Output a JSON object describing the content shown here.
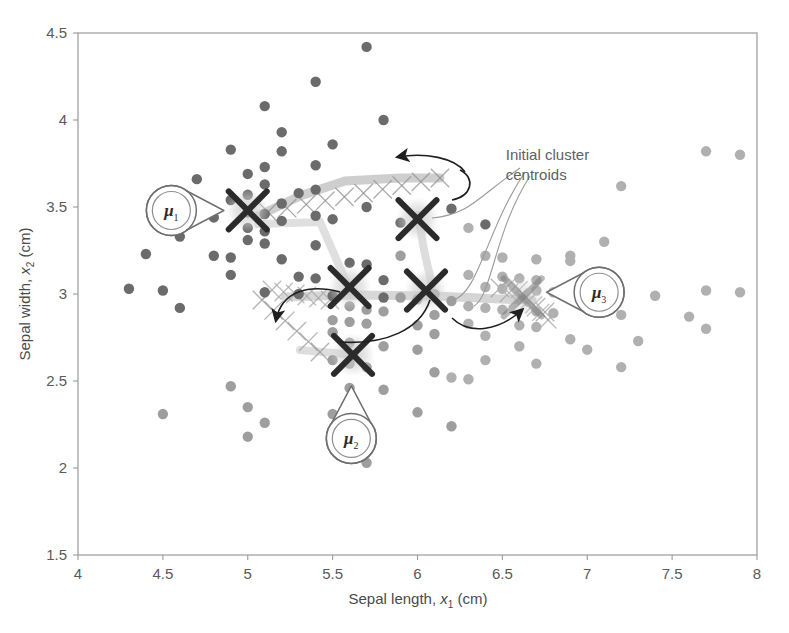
{
  "chart_data": {
    "type": "scatter",
    "title": "",
    "xlabel": "Sepal length, x₁ (cm)",
    "ylabel": "Sepal width, x₂ (cm)",
    "xlabel_parts": {
      "prefix": "Sepal length, ",
      "var": "x",
      "sub": "1",
      "suffix": " (cm)"
    },
    "ylabel_parts": {
      "prefix": "Sepal width, ",
      "var": "x",
      "sub": "2",
      "suffix": " (cm)"
    },
    "xlim": [
      4,
      8
    ],
    "ylim": [
      1.5,
      4.5
    ],
    "xticks": [
      4,
      4.5,
      5,
      5.5,
      6,
      6.5,
      7,
      7.5,
      8
    ],
    "xtick_labels": [
      "4",
      "4.5",
      "5",
      "5.5",
      "6",
      "6.5",
      "7",
      "7.5",
      "8"
    ],
    "yticks": [
      1.5,
      2,
      2.5,
      3,
      3.5,
      4,
      4.5
    ],
    "ytick_labels": [
      "1.5",
      "2",
      "2.5",
      "3",
      "3.5",
      "4",
      "4.5"
    ],
    "grid": false,
    "legend": "none",
    "frame": true,
    "colors": {
      "cluster1_dot": "#6b6b6b",
      "cluster2_dot": "#9e9e9e",
      "cluster3_dot": "#b0b0b0",
      "centroid_marker": "#2b2b2b",
      "centroid_glow": "#cfcfcf",
      "trail": "#c4c4c4",
      "leader": "#8a8a8a",
      "frame": "#9a9a9a",
      "text": "#4a4a4a"
    },
    "series": [
      {
        "name": "cluster-1",
        "color": "#6b6b6b",
        "points": [
          [
            5.7,
            4.42
          ],
          [
            5.4,
            4.22
          ],
          [
            5.1,
            4.08
          ],
          [
            5.8,
            4.0
          ],
          [
            5.2,
            3.93
          ],
          [
            5.5,
            3.86
          ],
          [
            4.9,
            3.83
          ],
          [
            5.2,
            3.82
          ],
          [
            5.4,
            3.74
          ],
          [
            5.1,
            3.73
          ],
          [
            5.0,
            3.69
          ],
          [
            4.7,
            3.66
          ],
          [
            5.1,
            3.63
          ],
          [
            5.4,
            3.6
          ],
          [
            5.3,
            3.58
          ],
          [
            5.0,
            3.57
          ],
          [
            4.9,
            3.54
          ],
          [
            5.2,
            3.52
          ],
          [
            5.7,
            3.5
          ],
          [
            6.2,
            3.49
          ],
          [
            5.0,
            3.47
          ],
          [
            5.1,
            3.46
          ],
          [
            5.4,
            3.45
          ],
          [
            4.8,
            3.44
          ],
          [
            5.5,
            3.43
          ],
          [
            5.2,
            3.42
          ],
          [
            5.9,
            3.41
          ],
          [
            6.4,
            3.4
          ],
          [
            5.0,
            3.38
          ],
          [
            5.1,
            3.36
          ],
          [
            4.6,
            3.33
          ],
          [
            5.0,
            3.31
          ],
          [
            5.1,
            3.29
          ],
          [
            5.4,
            3.28
          ],
          [
            4.4,
            3.23
          ],
          [
            4.8,
            3.22
          ],
          [
            4.9,
            3.21
          ],
          [
            5.2,
            3.2
          ],
          [
            5.6,
            3.18
          ],
          [
            5.7,
            3.17
          ],
          [
            4.9,
            3.11
          ],
          [
            5.3,
            3.1
          ],
          [
            5.4,
            3.09
          ],
          [
            5.8,
            3.08
          ],
          [
            4.3,
            3.03
          ],
          [
            4.5,
            3.02
          ],
          [
            5.1,
            3.01
          ],
          [
            5.3,
            3.0
          ],
          [
            5.5,
            2.99
          ],
          [
            5.8,
            2.98
          ],
          [
            4.6,
            2.92
          ]
        ]
      },
      {
        "name": "cluster-2",
        "color": "#9e9e9e",
        "points": [
          [
            5.9,
            3.22
          ],
          [
            6.1,
            3.0
          ],
          [
            5.9,
            2.98
          ],
          [
            6.0,
            2.97
          ],
          [
            6.2,
            2.96
          ],
          [
            5.6,
            2.93
          ],
          [
            5.7,
            2.91
          ],
          [
            5.8,
            2.9
          ],
          [
            6.1,
            2.88
          ],
          [
            5.5,
            2.85
          ],
          [
            5.6,
            2.84
          ],
          [
            5.7,
            2.83
          ],
          [
            6.0,
            2.82
          ],
          [
            5.5,
            2.78
          ],
          [
            6.1,
            2.77
          ],
          [
            5.6,
            2.72
          ],
          [
            5.8,
            2.7
          ],
          [
            6.0,
            2.68
          ],
          [
            5.5,
            2.62
          ],
          [
            5.6,
            2.6
          ],
          [
            5.7,
            2.58
          ],
          [
            6.1,
            2.55
          ],
          [
            4.9,
            2.47
          ],
          [
            5.6,
            2.46
          ],
          [
            5.8,
            2.45
          ],
          [
            5.0,
            2.35
          ],
          [
            6.0,
            2.32
          ],
          [
            5.5,
            2.31
          ],
          [
            4.5,
            2.31
          ],
          [
            5.1,
            2.26
          ],
          [
            6.2,
            2.24
          ],
          [
            5.0,
            2.18
          ],
          [
            5.7,
            2.03
          ]
        ]
      },
      {
        "name": "cluster-3",
        "color": "#b0b0b0",
        "points": [
          [
            7.2,
            3.62
          ],
          [
            7.7,
            3.82
          ],
          [
            7.9,
            3.8
          ],
          [
            7.1,
            3.3
          ],
          [
            6.9,
            3.22
          ],
          [
            7.7,
            3.02
          ],
          [
            7.9,
            3.01
          ],
          [
            6.3,
            3.38
          ],
          [
            6.4,
            3.22
          ],
          [
            6.5,
            3.21
          ],
          [
            6.7,
            3.2
          ],
          [
            6.9,
            3.19
          ],
          [
            6.3,
            3.11
          ],
          [
            6.5,
            3.1
          ],
          [
            6.6,
            3.09
          ],
          [
            6.7,
            3.08
          ],
          [
            6.4,
            3.04
          ],
          [
            6.5,
            3.03
          ],
          [
            6.7,
            3.02
          ],
          [
            6.8,
            3.01
          ],
          [
            7.1,
            3.0
          ],
          [
            7.4,
            2.99
          ],
          [
            6.3,
            2.93
          ],
          [
            6.4,
            2.92
          ],
          [
            6.5,
            2.91
          ],
          [
            6.7,
            2.9
          ],
          [
            6.8,
            2.89
          ],
          [
            7.2,
            2.88
          ],
          [
            7.6,
            2.87
          ],
          [
            6.3,
            2.83
          ],
          [
            6.6,
            2.82
          ],
          [
            6.7,
            2.81
          ],
          [
            7.7,
            2.8
          ],
          [
            6.4,
            2.76
          ],
          [
            6.9,
            2.74
          ],
          [
            7.3,
            2.73
          ],
          [
            6.6,
            2.7
          ],
          [
            7.0,
            2.68
          ],
          [
            6.4,
            2.62
          ],
          [
            6.7,
            2.6
          ],
          [
            7.2,
            2.58
          ],
          [
            6.2,
            2.52
          ],
          [
            6.3,
            2.51
          ]
        ]
      }
    ],
    "centroids": [
      {
        "name": "centroid-1-final",
        "x": 5.0,
        "y": 3.48,
        "style": "solid"
      },
      {
        "name": "centroid-2-initial",
        "x": 6.0,
        "y": 3.43,
        "style": "solid"
      },
      {
        "name": "centroid-3-mid",
        "x": 5.6,
        "y": 3.04,
        "style": "solid"
      },
      {
        "name": "centroid-4-mid",
        "x": 6.05,
        "y": 3.02,
        "style": "solid"
      },
      {
        "name": "centroid-5-final",
        "x": 5.62,
        "y": 2.65,
        "style": "solid"
      },
      {
        "name": "centroid-6-final",
        "x": 6.62,
        "y": 2.98,
        "style": "faint"
      }
    ],
    "annotations": [
      {
        "name": "initial-cluster-centroids-label",
        "lines": [
          "Initial cluster",
          "centroids"
        ],
        "x": 6.52,
        "y": 3.77
      }
    ],
    "callouts": [
      {
        "name": "mu-1",
        "label": "μ",
        "sub": "1",
        "x": 4.55,
        "y": 3.48,
        "direction": "right"
      },
      {
        "name": "mu-2",
        "label": "μ",
        "sub": "2",
        "x": 5.61,
        "y": 2.17,
        "direction": "up"
      },
      {
        "name": "mu-3",
        "label": "μ",
        "sub": "3",
        "x": 7.07,
        "y": 3.01,
        "direction": "left"
      }
    ]
  }
}
